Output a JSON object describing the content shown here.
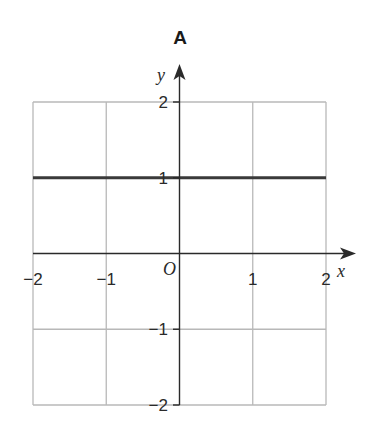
{
  "chart_data": {
    "type": "line",
    "title": "A",
    "xlabel": "x",
    "ylabel": "y",
    "origin_label": "O",
    "xlim": [
      -2,
      2
    ],
    "ylim": [
      -2,
      2
    ],
    "grid": true,
    "x_ticks": [
      -2,
      -1,
      1,
      2
    ],
    "y_ticks": [
      2,
      1,
      -1,
      -2
    ],
    "x_tick_labels": [
      "−2",
      "−1",
      "1",
      "2"
    ],
    "y_tick_labels": [
      "2",
      "1",
      "−1",
      "−2"
    ],
    "series": [
      {
        "name": "y = 1",
        "x": [
          -2,
          2
        ],
        "y": [
          1,
          1
        ],
        "color": "#3a3a3a"
      }
    ],
    "colors": {
      "grid": "#b8b8b8",
      "axis": "#2a2a2a",
      "line": "#3a3a3a"
    }
  }
}
